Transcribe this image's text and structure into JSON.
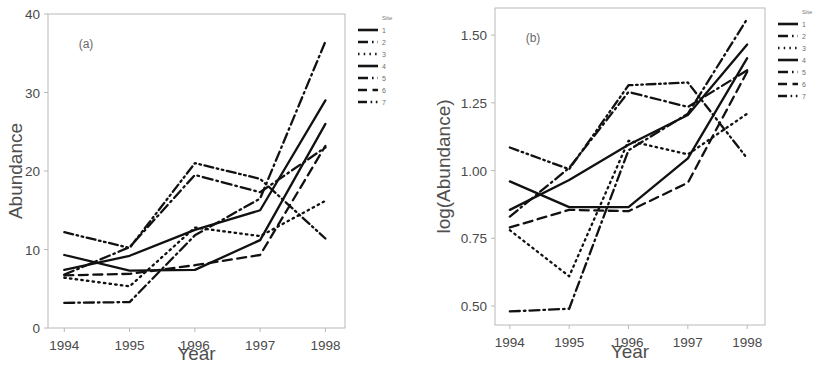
{
  "figure": {
    "panels": [
      {
        "id": "a",
        "label": "(a)",
        "xlabel": "Year",
        "ylabel": "Abundance"
      },
      {
        "id": "b",
        "label": "(b)",
        "xlabel": "Year",
        "ylabel": "log(Abundance)"
      }
    ],
    "legend": {
      "title": "Site",
      "items": [
        {
          "label": "1",
          "dash": "none"
        },
        {
          "label": "2",
          "dash": "dash-dot"
        },
        {
          "label": "3",
          "dash": "dot"
        },
        {
          "label": "4",
          "dash": "none"
        },
        {
          "label": "5",
          "dash": "dash-dot"
        },
        {
          "label": "6",
          "dash": "long-dash"
        },
        {
          "label": "7",
          "dash": "dash-dot-dot"
        }
      ]
    }
  },
  "chart_data": [
    {
      "type": "line",
      "panel": "a",
      "title": "(a)",
      "xlabel": "Year",
      "ylabel": "Abundance",
      "x": [
        1994,
        1995,
        1996,
        1997,
        1998
      ],
      "xticks": [
        "1994",
        "1995",
        "1996",
        "1997",
        "1998"
      ],
      "yticks": [
        0,
        10,
        20,
        30,
        40
      ],
      "ytick_labels": [
        "0",
        "10",
        "20",
        "30",
        "40"
      ],
      "xlim": [
        1993.75,
        1998.3
      ],
      "ylim": [
        0,
        40
      ],
      "grid": false,
      "legend_position": "right",
      "series": [
        {
          "name": "1",
          "dash": "none",
          "values": [
            7.4,
            9.2,
            12.5,
            15.0,
            29.0
          ]
        },
        {
          "name": "2",
          "dash": "dash-dot",
          "values": [
            3.2,
            3.3,
            11.8,
            16.5,
            36.5
          ]
        },
        {
          "name": "3",
          "dash": "dot",
          "values": [
            6.4,
            5.3,
            12.8,
            11.7,
            16.2
          ]
        },
        {
          "name": "4",
          "dash": "none",
          "values": [
            9.3,
            7.3,
            7.4,
            11.2,
            26.0
          ]
        },
        {
          "name": "5",
          "dash": "dash-dot",
          "values": [
            6.8,
            10.3,
            19.5,
            17.3,
            23.0
          ]
        },
        {
          "name": "6",
          "dash": "long-dash",
          "values": [
            6.7,
            6.9,
            8.0,
            9.3,
            23.2
          ]
        },
        {
          "name": "7",
          "dash": "dash-dot-dot",
          "values": [
            12.2,
            10.2,
            21.0,
            19.0,
            11.4
          ]
        }
      ]
    },
    {
      "type": "line",
      "panel": "b",
      "title": "(b)",
      "xlabel": "Year",
      "ylabel": "log(Abundance)",
      "x": [
        1994,
        1995,
        1996,
        1997,
        1998
      ],
      "xticks": [
        "1994",
        "1995",
        "1996",
        "1997",
        "1998"
      ],
      "yticks": [
        0.5,
        0.75,
        1.0,
        1.25,
        1.5
      ],
      "ytick_labels": [
        "0.50",
        "0.75",
        "1.00",
        "1.25",
        "1.50"
      ],
      "xlim": [
        1993.75,
        1998.3
      ],
      "ylim": [
        0.43,
        1.6
      ],
      "grid": false,
      "legend_position": "right",
      "series": [
        {
          "name": "1",
          "dash": "none",
          "values": [
            0.855,
            0.965,
            1.095,
            1.205,
            1.465
          ]
        },
        {
          "name": "2",
          "dash": "dash-dot",
          "values": [
            0.48,
            0.49,
            1.075,
            1.21,
            1.56
          ]
        },
        {
          "name": "3",
          "dash": "dot",
          "values": [
            0.78,
            0.61,
            1.11,
            1.06,
            1.21
          ]
        },
        {
          "name": "4",
          "dash": "none",
          "values": [
            0.96,
            0.865,
            0.865,
            1.045,
            1.415
          ]
        },
        {
          "name": "5",
          "dash": "dash-dot",
          "values": [
            0.83,
            1.01,
            1.29,
            1.235,
            1.37
          ]
        },
        {
          "name": "6",
          "dash": "long-dash",
          "values": [
            0.79,
            0.855,
            0.85,
            0.955,
            1.365
          ]
        },
        {
          "name": "7",
          "dash": "dash-dot-dot",
          "values": [
            1.085,
            1.005,
            1.315,
            1.325,
            1.045
          ]
        }
      ]
    }
  ]
}
